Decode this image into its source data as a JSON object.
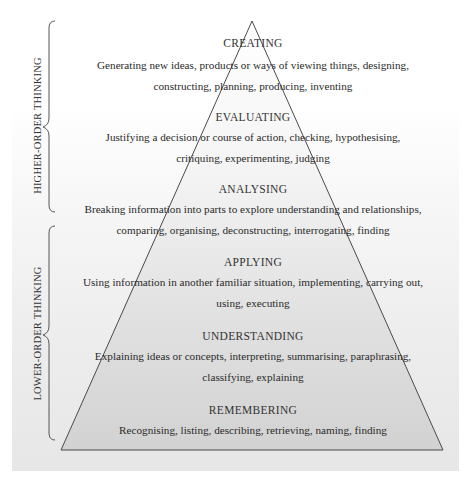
{
  "diagram": {
    "colors": {
      "outline": "#4a4a4a",
      "pyramid_top_fill": "#ffffff",
      "pyramid_bottom_fill": "#d4d4d4",
      "panel_bottom": "#e7e7e7",
      "text": "#2a2a2a"
    },
    "groups": [
      {
        "label": "HIGHER-ORDER THINKING",
        "levels": [
          "CREATING",
          "EVALUATING",
          "ANALYSING"
        ]
      },
      {
        "label": "LOWER-ORDER THINKING",
        "levels": [
          "APPLYING",
          "UNDERSTANDING",
          "REMEMBERING"
        ]
      }
    ],
    "levels": [
      {
        "title": "CREATING",
        "desc_lines": [
          "Generating new ideas, products or ways of viewing things, designing,",
          "constructing, planning, producing, inventing"
        ]
      },
      {
        "title": "EVALUATING",
        "desc_lines": [
          "Justifying a decision or course of action, checking, hypothesising,",
          "critiquing, experimenting, judging"
        ]
      },
      {
        "title": "ANALYSING",
        "desc_lines": [
          "Breaking information into parts to explore understanding and relationships,",
          "comparing, organising, deconstructing, interrogating, finding"
        ]
      },
      {
        "title": "APPLYING",
        "desc_lines": [
          "Using information in another familiar situation, implementing, carrying out,",
          "using, executing"
        ]
      },
      {
        "title": "UNDERSTANDING",
        "desc_lines": [
          "Explaining ideas or concepts, interpreting, summarising, paraphrasing,",
          "classifying, explaining"
        ]
      },
      {
        "title": "REMEMBERING",
        "desc_lines": [
          "Recognising, listing, describing, retrieving, naming, finding"
        ]
      }
    ]
  }
}
